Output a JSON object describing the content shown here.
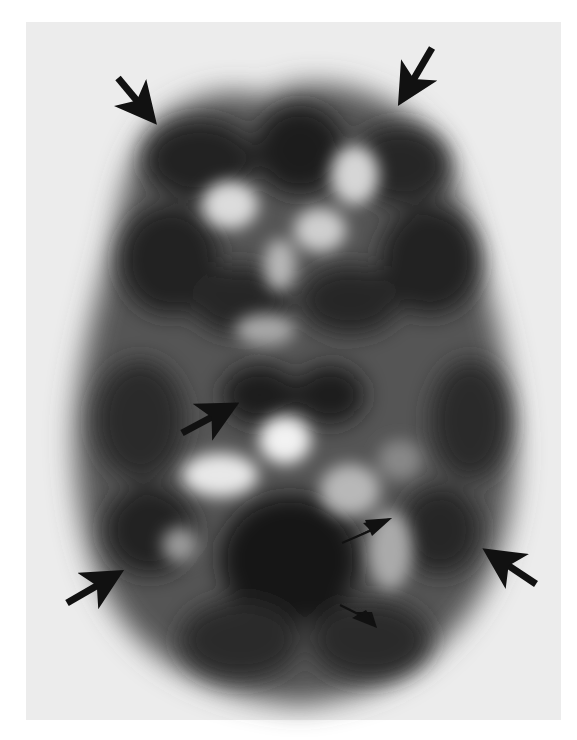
{
  "image": {
    "type": "axial brain perfusion scan (grayscale)",
    "background_color": "#ececec",
    "page_color": "#ffffff",
    "tissue_dark_color": "#262626",
    "tissue_bright_color": "#f2f2f2",
    "marker_color": "#111111"
  },
  "annotations": {
    "arrows": [
      {
        "name": "arrow-top-left",
        "tail": [
          118,
          78
        ],
        "tip": [
          154,
          122
        ]
      },
      {
        "name": "arrow-top-right",
        "tail": [
          432,
          48
        ],
        "tip": [
          401,
          101
        ]
      },
      {
        "name": "arrow-mid-left",
        "tail": [
          182,
          433
        ],
        "tip": [
          235,
          405
        ]
      },
      {
        "name": "arrow-bottom-left",
        "tail": [
          67,
          603
        ],
        "tip": [
          120,
          573
        ]
      },
      {
        "name": "arrow-bottom-right",
        "tail": [
          536,
          584
        ],
        "tip": [
          487,
          551
        ]
      }
    ],
    "arrowheads": [
      {
        "name": "arrowhead-upper",
        "tail": [
          340,
          543
        ],
        "tip": [
          392,
          518
        ]
      },
      {
        "name": "arrowhead-lower",
        "tail": [
          340,
          605
        ],
        "tip": [
          377,
          627
        ]
      }
    ]
  }
}
